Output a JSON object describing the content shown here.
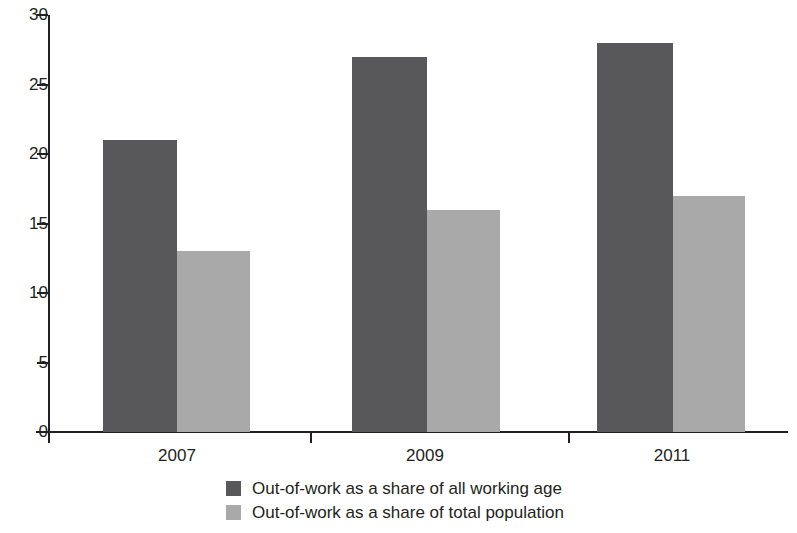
{
  "chart_data": {
    "type": "bar",
    "title": "",
    "subtitle": "",
    "xlabel": "",
    "ylabel": "",
    "categories": [
      "2007",
      "2009",
      "2011"
    ],
    "series": [
      {
        "name": "Out-of-work as a share of all working age",
        "color": "#58585a",
        "values": [
          21,
          27,
          28
        ]
      },
      {
        "name": "Out-of-work as a share of total population",
        "color": "#a9a9a9",
        "values": [
          13,
          16,
          17
        ]
      }
    ],
    "ylim": [
      0,
      30
    ],
    "ytick_labels": [
      "0",
      "5",
      "10",
      "15",
      "20",
      "25",
      "30"
    ],
    "ytick_values": [
      0,
      5,
      10,
      15,
      20,
      25,
      30
    ],
    "grid": false,
    "legend_position": "bottom",
    "annotations": []
  },
  "axes": {
    "y_ticks": [
      {
        "value": 30,
        "label": "30"
      },
      {
        "value": 25,
        "label": "25"
      },
      {
        "value": 20,
        "label": "20"
      },
      {
        "value": 15,
        "label": "15"
      },
      {
        "value": 10,
        "label": "10"
      },
      {
        "value": 5,
        "label": "5"
      },
      {
        "value": 0,
        "label": "0"
      }
    ],
    "x_ticks": [
      {
        "label": "2007"
      },
      {
        "label": "2009"
      },
      {
        "label": "2011"
      }
    ]
  },
  "legend": {
    "items": [
      {
        "label": "Out-of-work as a share of all working age",
        "color": "#58585a"
      },
      {
        "label": "Out-of-work as a share of total population",
        "color": "#a9a9a9"
      }
    ]
  },
  "colors": {
    "series_dark": "#58585a",
    "series_light": "#a9a9a9",
    "axis": "#231f20",
    "background": "#ffffff"
  }
}
